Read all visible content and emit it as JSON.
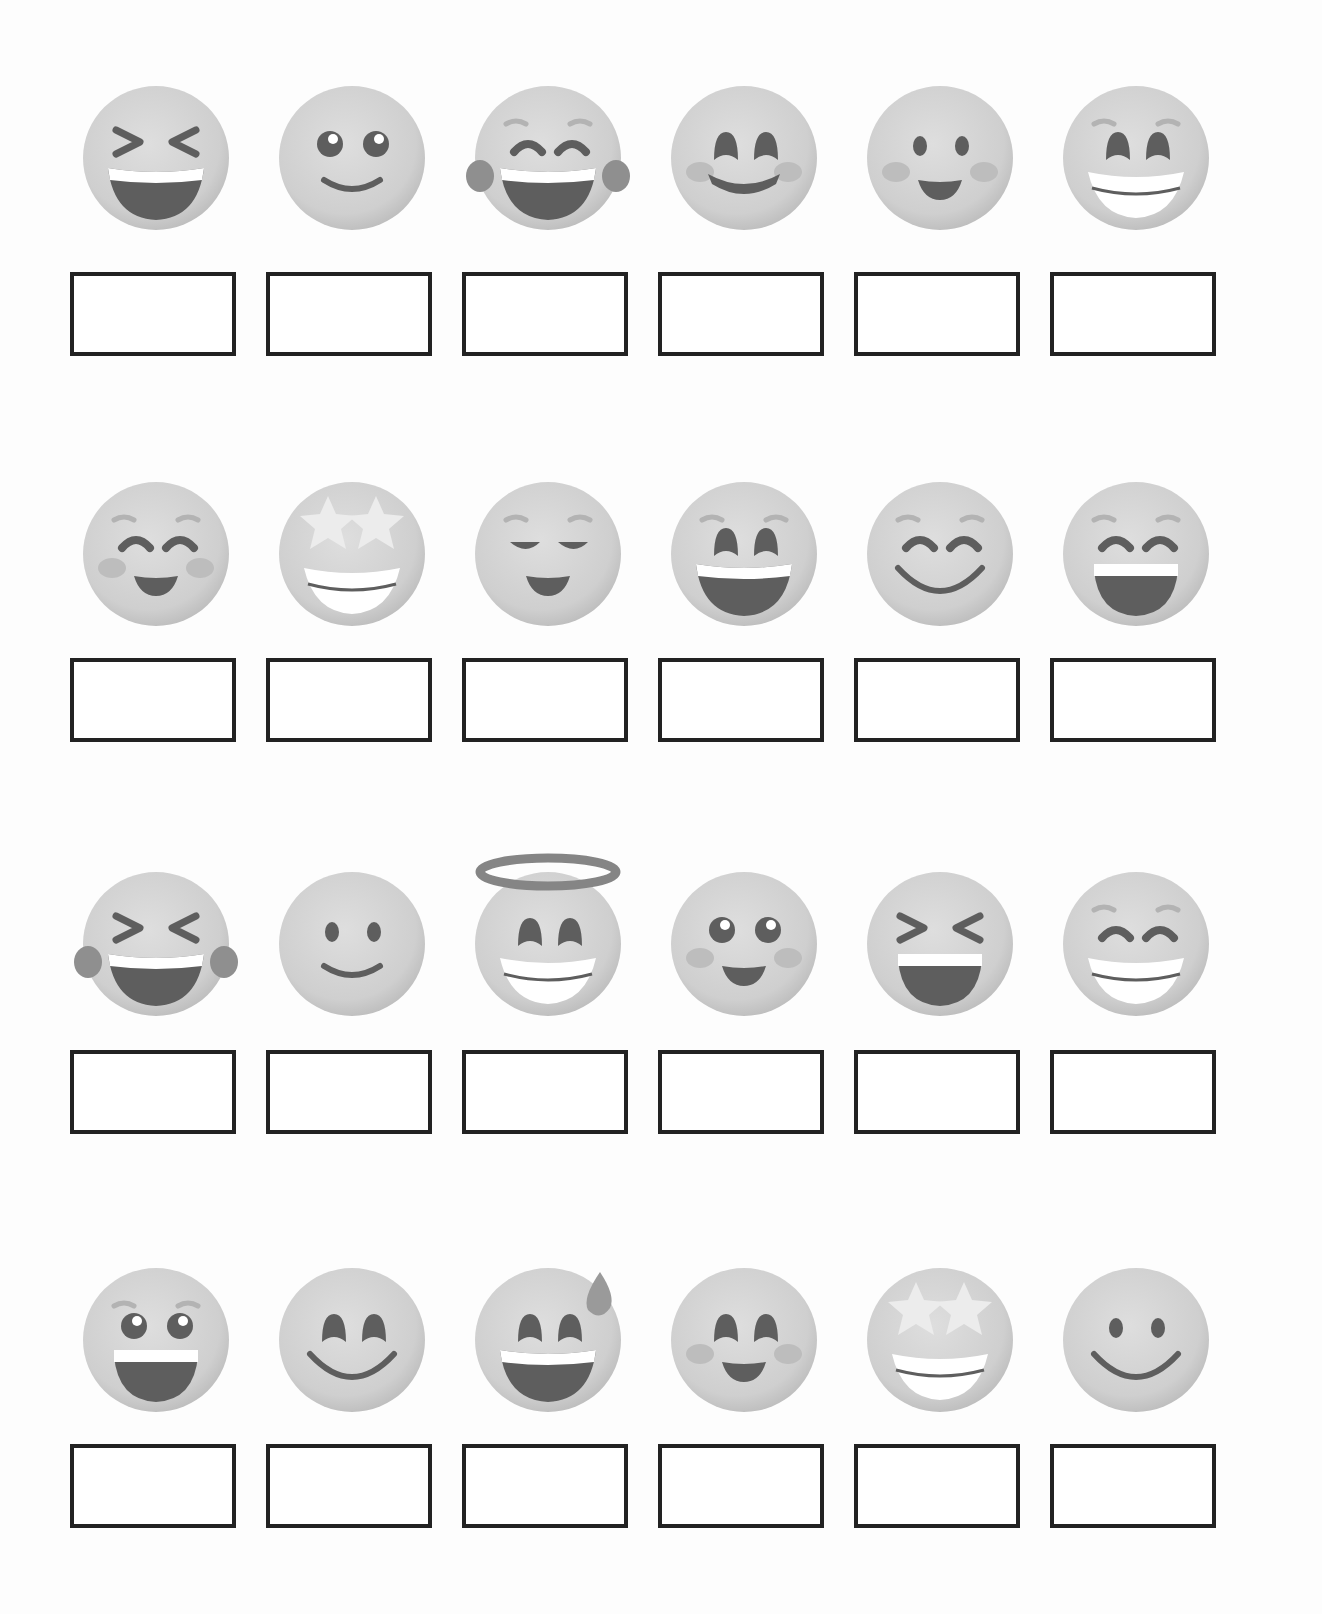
{
  "worksheet": {
    "colors": {
      "face": "#cfcfcf",
      "face_shade": "#b9b9b9",
      "feature": "#5e5e5e",
      "brow": "#b3b3b3",
      "teeth": "#ffffff",
      "box_border": "#222222",
      "background": "#ffffff"
    },
    "rows": [
      {
        "items": [
          {
            "emoji": "grinning-squinting-face-icon",
            "answer": ""
          },
          {
            "emoji": "smiling-face-big-eyes-icon",
            "answer": ""
          },
          {
            "emoji": "face-with-tears-of-joy-icon",
            "answer": ""
          },
          {
            "emoji": "smiling-face-smiling-eyes-icon",
            "answer": ""
          },
          {
            "emoji": "slightly-smiling-blush-face-icon",
            "answer": ""
          },
          {
            "emoji": "beaming-face-icon",
            "answer": ""
          }
        ]
      },
      {
        "items": [
          {
            "emoji": "smiling-face-closed-eyes-icon",
            "answer": ""
          },
          {
            "emoji": "star-struck-face-icon",
            "answer": ""
          },
          {
            "emoji": "relieved-face-icon",
            "answer": ""
          },
          {
            "emoji": "grinning-smiling-eyes-icon",
            "answer": ""
          },
          {
            "emoji": "happy-closed-eyes-wide-smile-icon",
            "answer": ""
          },
          {
            "emoji": "grinning-face-smiling-eyes-open-mouth-icon",
            "answer": ""
          }
        ]
      },
      {
        "items": [
          {
            "emoji": "rolling-laughing-tears-icon",
            "answer": ""
          },
          {
            "emoji": "slightly-smiling-face-icon",
            "answer": ""
          },
          {
            "emoji": "smiling-face-with-halo-icon",
            "answer": ""
          },
          {
            "emoji": "smiling-face-big-eyes-blush-icon",
            "answer": ""
          },
          {
            "emoji": "grinning-squinting-open-mouth-icon",
            "answer": ""
          },
          {
            "emoji": "beaming-face-closed-eyes-icon",
            "answer": ""
          }
        ]
      },
      {
        "items": [
          {
            "emoji": "grinning-face-big-eyes-icon",
            "answer": ""
          },
          {
            "emoji": "smiling-eyes-wide-smile-icon",
            "answer": ""
          },
          {
            "emoji": "grinning-face-with-sweat-icon",
            "answer": ""
          },
          {
            "emoji": "smiling-face-smiling-eyes-blush-icon",
            "answer": ""
          },
          {
            "emoji": "star-struck-face-icon",
            "answer": ""
          },
          {
            "emoji": "smiling-face-icon",
            "answer": ""
          }
        ]
      }
    ]
  }
}
